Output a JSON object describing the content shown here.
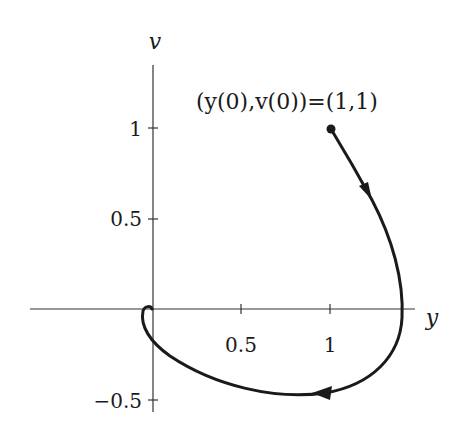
{
  "figure": {
    "type": "phase-portrait",
    "axes": {
      "x_label": "y",
      "y_label": "v",
      "x_ticks": [
        {
          "value": 0.5,
          "label": "0.5"
        },
        {
          "value": 1,
          "label": "1"
        }
      ],
      "y_ticks": [
        {
          "value": 1,
          "label": "1"
        },
        {
          "value": 0.5,
          "label": "0.5"
        },
        {
          "value": -0.5,
          "label": "−0.5"
        }
      ]
    },
    "annotation": "(y(0),v(0))=(1,1)",
    "initial_point": {
      "y": 1,
      "v": 1
    },
    "trajectory_color": "#1a1a1a",
    "axis_color": "#333333"
  }
}
